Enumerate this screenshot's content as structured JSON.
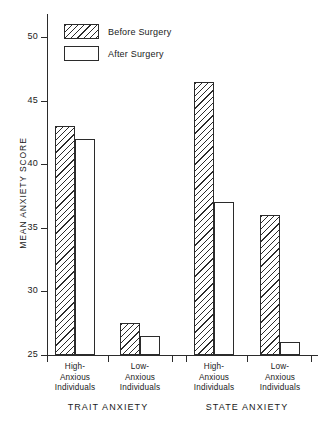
{
  "chart_data": {
    "type": "bar",
    "title": "",
    "xlabel": "",
    "ylabel": "MEAN ANXIETY SCORE",
    "ylim": [
      25,
      51.5
    ],
    "yticks": [
      25,
      30,
      35,
      40,
      45,
      50
    ],
    "grid": false,
    "legend_position": "top-left",
    "sections": [
      {
        "name": "TRAIT ANXIETY"
      },
      {
        "name": "STATE ANXIETY"
      }
    ],
    "categories": [
      "High-\nAnxious\nIndividuals",
      "Low-\nAnxious\nIndividuals",
      "High-\nAnxious\nIndividuals",
      "Low-\nAnxious\nIndividuals"
    ],
    "series": [
      {
        "name": "Before Surgery",
        "fill": "hatched",
        "values": [
          43.0,
          27.5,
          46.5,
          36.0
        ]
      },
      {
        "name": "After Surgery",
        "fill": "white",
        "values": [
          42.0,
          26.5,
          37.0,
          26.0
        ]
      }
    ]
  },
  "axis": {
    "y_title": "MEAN ANXIETY SCORE",
    "y_ticks": [
      {
        "label": "50"
      },
      {
        "label": "45"
      },
      {
        "label": "40"
      },
      {
        "label": "35"
      },
      {
        "label": "30"
      },
      {
        "label": "25"
      }
    ]
  },
  "legend": {
    "items": [
      {
        "label": "Before Surgery"
      },
      {
        "label": "After Surgery"
      }
    ]
  },
  "groups": [
    {
      "line1": "High-",
      "line2": "Anxious",
      "line3": "Individuals"
    },
    {
      "line1": "Low-",
      "line2": "Anxious",
      "line3": "Individuals"
    },
    {
      "line1": "High-",
      "line2": "Anxious",
      "line3": "Individuals"
    },
    {
      "line1": "Low-",
      "line2": "Anxious",
      "line3": "Individuals"
    }
  ],
  "sections": [
    {
      "label": "TRAIT ANXIETY"
    },
    {
      "label": "STATE ANXIETY"
    }
  ],
  "colors": {
    "ink": "#2b2b2b",
    "background": "#ffffff"
  }
}
